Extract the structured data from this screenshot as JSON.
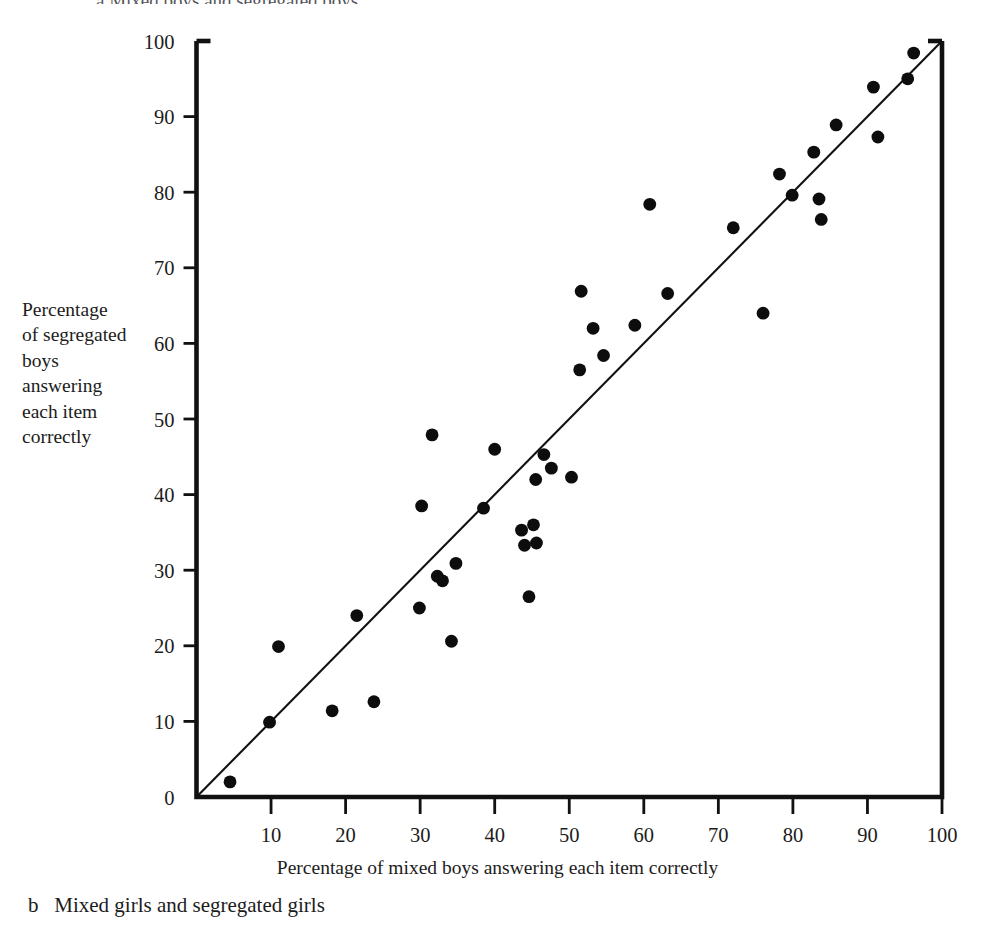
{
  "figure": {
    "top_clipped_caption": "a  Mixed boys and segregated boys",
    "bottom_caption": "b   Mixed girls and segregated girls",
    "y_axis_caption": "Percentage\nof segregated\nboys\nanswering\neach item\ncorrectly",
    "x_axis_caption": "Percentage of mixed boys answering each item correctly",
    "colors": {
      "ink": "#1a1a1a",
      "axis": "#111111",
      "marker": "#0d0d0d",
      "background": "#ffffff"
    }
  },
  "chart_data": {
    "type": "scatter",
    "title": "a  Mixed boys and segregated boys",
    "xlabel": "Percentage of mixed boys answering each item correctly",
    "ylabel": "Percentage of segregated boys answering each item correctly",
    "xlim": [
      0,
      100
    ],
    "ylim": [
      0,
      100
    ],
    "grid": false,
    "legend": "none",
    "xticks": [
      0,
      10,
      20,
      30,
      40,
      50,
      60,
      70,
      80,
      90,
      100
    ],
    "yticks": [
      0,
      10,
      20,
      30,
      40,
      50,
      60,
      70,
      80,
      90,
      100
    ],
    "reference_line": {
      "description": "y = x identity line",
      "from": [
        0,
        0
      ],
      "to": [
        100,
        100
      ]
    },
    "series": [
      {
        "name": "Test items",
        "marker": "filled-circle",
        "points": [
          [
            4.5,
            2.0
          ],
          [
            9.8,
            9.9
          ],
          [
            11.0,
            19.9
          ],
          [
            18.2,
            11.4
          ],
          [
            21.5,
            24.0
          ],
          [
            23.8,
            12.6
          ],
          [
            29.9,
            25.0
          ],
          [
            30.2,
            38.5
          ],
          [
            31.6,
            47.9
          ],
          [
            32.3,
            29.2
          ],
          [
            33.0,
            28.6
          ],
          [
            34.2,
            20.6
          ],
          [
            34.8,
            30.9
          ],
          [
            38.5,
            38.2
          ],
          [
            40.0,
            46.0
          ],
          [
            43.6,
            35.3
          ],
          [
            44.0,
            33.3
          ],
          [
            44.6,
            26.5
          ],
          [
            45.2,
            36.0
          ],
          [
            45.5,
            42.0
          ],
          [
            45.6,
            33.6
          ],
          [
            46.6,
            45.3
          ],
          [
            47.6,
            43.5
          ],
          [
            50.3,
            42.3
          ],
          [
            51.4,
            56.5
          ],
          [
            51.6,
            66.9
          ],
          [
            53.2,
            62.0
          ],
          [
            54.6,
            58.4
          ],
          [
            58.8,
            62.4
          ],
          [
            60.8,
            78.4
          ],
          [
            63.2,
            66.6
          ],
          [
            72.0,
            75.3
          ],
          [
            76.0,
            64.0
          ],
          [
            78.2,
            82.4
          ],
          [
            79.9,
            79.6
          ],
          [
            82.8,
            85.3
          ],
          [
            83.5,
            79.1
          ],
          [
            83.8,
            76.4
          ],
          [
            85.8,
            88.9
          ],
          [
            90.8,
            93.9
          ],
          [
            91.4,
            87.3
          ],
          [
            95.4,
            95.0
          ],
          [
            96.2,
            98.4
          ]
        ]
      }
    ]
  }
}
